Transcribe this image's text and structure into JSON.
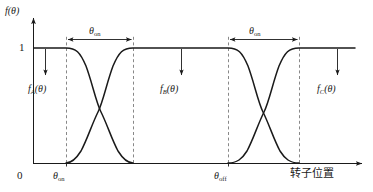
{
  "figure": {
    "title": "",
    "background_color": "#ffffff",
    "curve_color": "#1a1a1a",
    "axis_color": "#1a1a1a",
    "dashed_color": "#555555"
  },
  "axes": {
    "y_label": "f(θ)",
    "y_ticks": [
      "1",
      "0"
    ],
    "y_tick_one": "1",
    "y_tick_zero": "0",
    "x_label": "转子位置",
    "x_tick_labels": [
      "θon",
      "θoff"
    ]
  },
  "annotations": {
    "span_label_1": "θon",
    "span_label_2": "θon",
    "curve_label_a": "fA(θ)",
    "curve_label_b": "fB(θ)",
    "curve_label_c": "fC(θ)",
    "axis_mark_on": "θon",
    "axis_mark_off": "θoff"
  },
  "chart_data": {
    "type": "line",
    "title": "",
    "xlabel": "转子位置",
    "ylabel": "f(θ)",
    "ylim": [
      0,
      1
    ],
    "xlim": [
      0,
      340
    ],
    "grid": false,
    "legend": "inline-annotations",
    "y_tick_values": [
      0,
      1
    ],
    "y_tick_labels": [
      "0",
      "1"
    ],
    "x_marked_positions": [
      {
        "label": "θon",
        "x": 66
      },
      {
        "label": "θoff",
        "x": 228
      }
    ],
    "conduction_spans": [
      {
        "label": "θon",
        "x_start": 66,
        "x_end": 133,
        "y": 1.0
      },
      {
        "label": "θon",
        "x_start": 228,
        "x_end": 299,
        "y": 1.0
      }
    ],
    "pointer_annotations": [
      {
        "label": "fA(θ)",
        "x": 45,
        "y_from": 1.0,
        "y_to": 0.62
      },
      {
        "label": "fB(θ)",
        "x": 181,
        "y_from": 1.0,
        "y_to": 0.62
      },
      {
        "label": "fC(θ)",
        "x": 338,
        "y_from": 1.0,
        "y_to": 0.62
      }
    ],
    "series": [
      {
        "name": "fA(θ)",
        "description": "holds 1 from origin to θon then falls smoothly to 0 across first overlap window",
        "points": [
          [
            0,
            1
          ],
          [
            66,
            1
          ],
          [
            82,
            0.86
          ],
          [
            90,
            0.7
          ],
          [
            99,
            0.5
          ],
          [
            108,
            0.3
          ],
          [
            117,
            0.14
          ],
          [
            133,
            0
          ]
        ]
      },
      {
        "name": "fB(θ)",
        "description": "rises from 0 to 1 across first overlap, holds 1 until θoff, then falls to 0 across second overlap",
        "points": [
          [
            66,
            0
          ],
          [
            82,
            0.14
          ],
          [
            90,
            0.3
          ],
          [
            99,
            0.5
          ],
          [
            108,
            0.7
          ],
          [
            117,
            0.86
          ],
          [
            133,
            1
          ],
          [
            228,
            1
          ],
          [
            244,
            0.86
          ],
          [
            252,
            0.7
          ],
          [
            262,
            0.5
          ],
          [
            272,
            0.3
          ],
          [
            282,
            0.14
          ],
          [
            299,
            0
          ]
        ]
      },
      {
        "name": "fC(θ)",
        "description": "rises from 0 to 1 across second overlap window starting at θoff then holds 1",
        "points": [
          [
            228,
            0
          ],
          [
            244,
            0.14
          ],
          [
            252,
            0.3
          ],
          [
            262,
            0.5
          ],
          [
            272,
            0.7
          ],
          [
            282,
            0.86
          ],
          [
            299,
            1
          ],
          [
            340,
            1
          ]
        ]
      }
    ]
  }
}
